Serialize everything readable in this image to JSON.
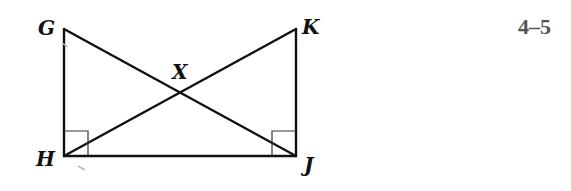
{
  "diagram": {
    "problem_number": "4–5",
    "points": [
      {
        "name": "G"
      },
      {
        "name": "H"
      },
      {
        "name": "J"
      },
      {
        "name": "K"
      },
      {
        "name": "X"
      }
    ],
    "segments": [
      "GH",
      "HJ",
      "JK",
      "GJ",
      "HK"
    ],
    "right_angles": [
      "H",
      "J"
    ],
    "intersection": {
      "point": "X",
      "of": [
        "GJ",
        "HK"
      ]
    }
  }
}
